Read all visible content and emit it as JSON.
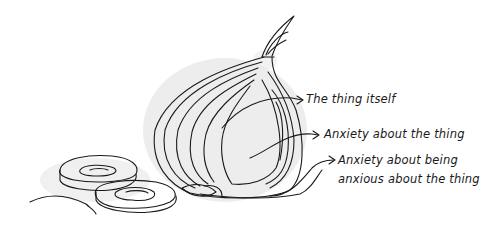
{
  "illustration": {
    "subject": "onion-cross-section",
    "colors": {
      "ink": "#1a1a1a",
      "shadow": "#e6e6e6",
      "background": "#ffffff"
    }
  },
  "annotations": [
    {
      "id": "layer-1",
      "text": "The thing itself"
    },
    {
      "id": "layer-2",
      "text": "Anxiety about the thing"
    },
    {
      "id": "layer-3",
      "line1": "Anxiety about being",
      "line2": "anxious about the thing"
    }
  ]
}
